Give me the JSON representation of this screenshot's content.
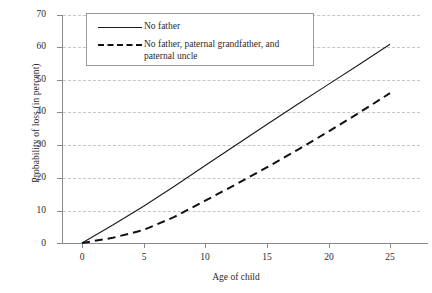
{
  "chart_data": {
    "type": "line",
    "title": "",
    "xlabel": "Age of child",
    "ylabel": "Probability of loss (in percent)",
    "xlim": [
      0,
      25
    ],
    "ylim": [
      0,
      70
    ],
    "xticks": [
      0,
      5,
      10,
      15,
      20,
      25
    ],
    "yticks": [
      0,
      10,
      20,
      30,
      40,
      50,
      60,
      70
    ],
    "grid": true,
    "legend_position": "top-left-inside",
    "series": [
      {
        "name": "No father",
        "style": "solid",
        "color": "#1a1a1a",
        "x": [
          0,
          2.5,
          5,
          7.5,
          10,
          12.5,
          15,
          17.5,
          20,
          22.5,
          25
        ],
        "values": [
          0,
          5.5,
          11.3,
          17.4,
          23.8,
          30.1,
          36.4,
          42.6,
          48.7,
          54.8,
          61.0
        ]
      },
      {
        "name": "No father, paternal grandfather, and paternal uncle",
        "style": "dashed",
        "color": "#111111",
        "x": [
          0,
          2.5,
          5,
          7.5,
          10,
          12.5,
          15,
          17.5,
          20,
          22.5,
          25
        ],
        "values": [
          0,
          1.6,
          4.0,
          8.0,
          13.0,
          18.0,
          23.2,
          28.6,
          34.2,
          40.0,
          46.0
        ]
      }
    ]
  },
  "axes": {
    "y_title": "Probability of loss (in percent)",
    "x_title": "Age of child",
    "y_tick_labels": [
      "0",
      "10",
      "20",
      "30",
      "40",
      "50",
      "60",
      "70"
    ],
    "x_tick_labels": [
      "0",
      "5",
      "10",
      "15",
      "20",
      "25"
    ]
  },
  "legend": {
    "entries": [
      {
        "label": "No father",
        "style": "solid"
      },
      {
        "label": "No father, paternal grandfather, and paternal uncle",
        "style": "dashed"
      }
    ]
  },
  "colors": {
    "line": "#1a1a1a",
    "grid": "#c6c6c6",
    "axis": "#8a8a8a",
    "text": "#2b2b2b",
    "background": "#ffffff"
  }
}
